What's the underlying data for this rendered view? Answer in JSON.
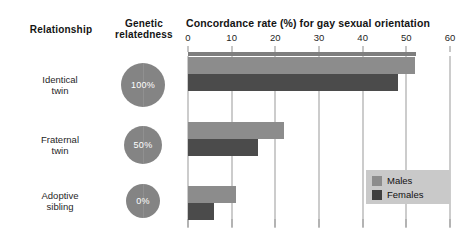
{
  "headers": {
    "relationship": "Relationship",
    "relatedness": "Genetic relatedness"
  },
  "legend": {
    "males_label": "Males",
    "females_label": "Females",
    "males_color": "#8c8c8c",
    "females_color": "#3f3f3f",
    "background_color": "#c9c9c9",
    "position": "inside-lower-right"
  },
  "relatedness": {
    "values": [
      "100%",
      "50%",
      "0%"
    ],
    "circle_color": "#848484"
  },
  "chart_data": {
    "type": "bar",
    "orientation": "horizontal",
    "title": "Concordance rate (%) for gay sexual orientation",
    "xlabel": "Concordance rate (%) for gay sexual orientation",
    "ylabel": "Relationship",
    "categories": [
      "Identical twin",
      "Fraternal twin",
      "Adoptive sibling"
    ],
    "category_lines": [
      [
        "Identical",
        "twin"
      ],
      [
        "Fraternal",
        "twin"
      ],
      [
        "Adoptive",
        "sibling"
      ]
    ],
    "series": [
      {
        "name": "Males",
        "color": "#8c8c8c",
        "values": [
          52,
          22,
          11
        ]
      },
      {
        "name": "Females",
        "color": "#4b4b4b",
        "values": [
          48,
          16,
          6
        ]
      }
    ],
    "xlim": [
      0,
      60
    ],
    "xticks": [
      0,
      10,
      20,
      30,
      40,
      50,
      60
    ],
    "xticklabels": [
      "0",
      "10",
      "20",
      "30",
      "40",
      "50",
      "60"
    ],
    "grid": "vertical",
    "legend_entries": [
      "Males",
      "Females"
    ],
    "annotations": [
      "100%",
      "50%",
      "0%"
    ]
  }
}
